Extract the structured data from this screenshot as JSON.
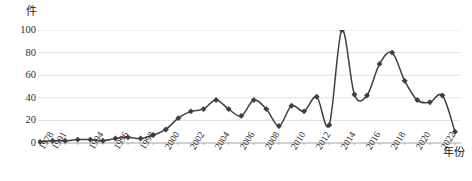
{
  "chart_data": {
    "type": "line",
    "title": "",
    "subtitle": "",
    "xlabel": "年份",
    "ylabel": "件",
    "ylim": [
      0,
      100
    ],
    "xlim": [
      1978,
      2022
    ],
    "grid": true,
    "legend": false,
    "legend_position": "none",
    "line_color": "#3f3f3f",
    "marker_color": "#3f3f3f",
    "marker": "diamond",
    "smoothing": "spline",
    "y_ticks": [
      0,
      20,
      40,
      60,
      80,
      100
    ],
    "x_tick_labels": [
      "1978",
      "1991",
      "1994",
      "1996",
      "1998",
      "2000",
      "2002",
      "2004",
      "2006",
      "2008",
      "2010",
      "2012",
      "2014",
      "2016",
      "2018",
      "2020",
      "2022"
    ],
    "x": [
      1978,
      1991,
      1992,
      1993,
      1994,
      1995,
      1996,
      1997,
      1998,
      1999,
      2000,
      2001,
      2002,
      2003,
      2004,
      2005,
      2006,
      2007,
      2008,
      2009,
      2010,
      2011,
      2012,
      2013,
      2014,
      2015,
      2016,
      2017,
      2018,
      2019,
      2020,
      2021,
      2022
    ],
    "values": [
      1,
      2,
      2,
      3,
      3,
      2,
      4,
      4,
      3,
      6,
      5,
      12,
      22,
      28,
      30,
      38,
      36,
      26,
      38,
      36,
      21,
      34,
      16,
      30,
      33,
      41,
      29,
      36,
      15,
      43,
      100,
      43,
      42
    ],
    "series": [
      {
        "name": "件数",
        "points": [
          {
            "x": 1978,
            "y": 1
          },
          {
            "x": 1991,
            "y": 2
          },
          {
            "x": 1992,
            "y": 2
          },
          {
            "x": 1993,
            "y": 3
          },
          {
            "x": 1994,
            "y": 3
          },
          {
            "x": 1995,
            "y": 2
          },
          {
            "x": 1996,
            "y": 4
          },
          {
            "x": 1997,
            "y": 5
          },
          {
            "x": 1998,
            "y": 4
          },
          {
            "x": 1999,
            "y": 7
          },
          {
            "x": 2000,
            "y": 12
          },
          {
            "x": 2001,
            "y": 22
          },
          {
            "x": 2002,
            "y": 28
          },
          {
            "x": 2003,
            "y": 30
          },
          {
            "x": 2004,
            "y": 38
          },
          {
            "x": 2005,
            "y": 30
          },
          {
            "x": 2006,
            "y": 24
          },
          {
            "x": 2007,
            "y": 38
          },
          {
            "x": 2008,
            "y": 30
          },
          {
            "x": 2009,
            "y": 15
          },
          {
            "x": 2010,
            "y": 33
          },
          {
            "x": 2011,
            "y": 28
          },
          {
            "x": 2012,
            "y": 41
          },
          {
            "x": 2013,
            "y": 16
          },
          {
            "x": 2014,
            "y": 100
          },
          {
            "x": 2015,
            "y": 43
          },
          {
            "x": 2016,
            "y": 42
          },
          {
            "x": 2017,
            "y": 70
          },
          {
            "x": 2018,
            "y": 80
          },
          {
            "x": 2019,
            "y": 55
          },
          {
            "x": 2020,
            "y": 38
          },
          {
            "x": 2021,
            "y": 36
          },
          {
            "x": 2022,
            "y": 42
          },
          {
            "x": 2023,
            "y": 10
          }
        ]
      }
    ],
    "annotations": []
  }
}
